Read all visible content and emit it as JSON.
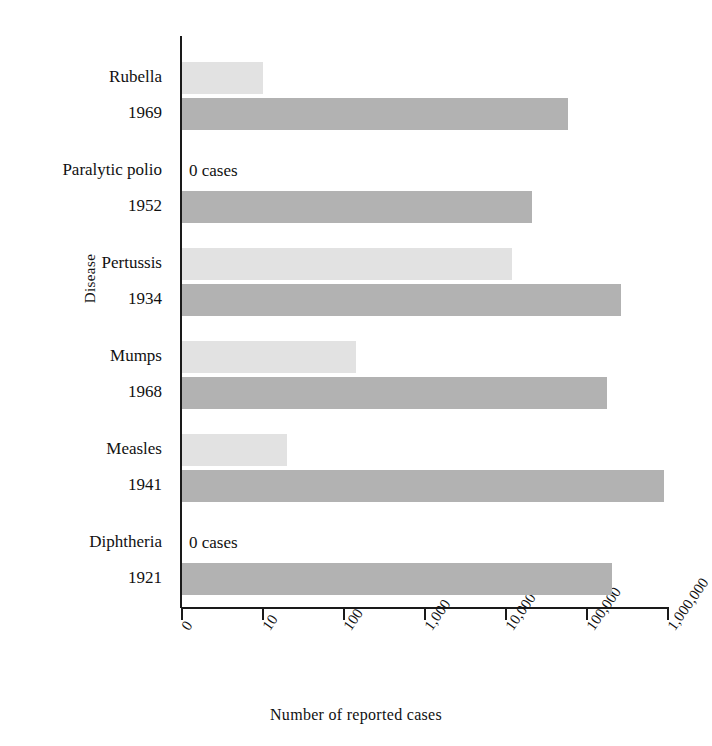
{
  "chart_data": {
    "type": "bar",
    "orientation": "horizontal",
    "title": "",
    "xlabel": "Number of reported cases",
    "ylabel": "Disease",
    "xscale": "log",
    "xlim": [
      0,
      1000000
    ],
    "grid": false,
    "legend": "none",
    "xticks": [
      {
        "label": "0",
        "value": 0
      },
      {
        "label": "10",
        "value": 10
      },
      {
        "label": "100",
        "value": 100
      },
      {
        "label": "1,000",
        "value": 1000
      },
      {
        "label": "10,000",
        "value": 10000
      },
      {
        "label": "100,000",
        "value": 100000
      },
      {
        "label": "1,000,000",
        "value": 1000000
      }
    ],
    "categories": [
      "Rubella",
      "Paralytic polio",
      "Pertussis",
      "Mumps",
      "Measles",
      "Diphtheria"
    ],
    "series": [
      {
        "name": "recent",
        "color": "#e2e2e2",
        "values": [
          10,
          0,
          12000,
          140,
          20,
          0
        ]
      },
      {
        "name": "historic peak",
        "color": "#b2b2b2",
        "values": [
          57700,
          21000,
          265000,
          175000,
          894000,
          206000
        ]
      }
    ],
    "rows": [
      {
        "disease": "Rubella",
        "peak_year": "1969",
        "recent_value": 10,
        "recent_note": "",
        "historic_value": 57700
      },
      {
        "disease": "Paralytic polio",
        "peak_year": "1952",
        "recent_value": 0,
        "recent_note": "0 cases",
        "historic_value": 21000
      },
      {
        "disease": "Pertussis",
        "peak_year": "1934",
        "recent_value": 12000,
        "recent_note": "",
        "historic_value": 265000
      },
      {
        "disease": "Mumps",
        "peak_year": "1968",
        "recent_value": 140,
        "recent_note": "",
        "historic_value": 175000
      },
      {
        "disease": "Measles",
        "peak_year": "1941",
        "recent_value": 20,
        "recent_note": "",
        "historic_value": 894000
      },
      {
        "disease": "Diphtheria",
        "peak_year": "1921",
        "recent_value": 0,
        "recent_note": "0 cases",
        "historic_value": 206000
      }
    ]
  },
  "colors": {
    "recent_bar": "#e2e2e2",
    "historic_bar": "#b2b2b2",
    "axis": "#1a1a1a",
    "background": "#ffffff"
  }
}
